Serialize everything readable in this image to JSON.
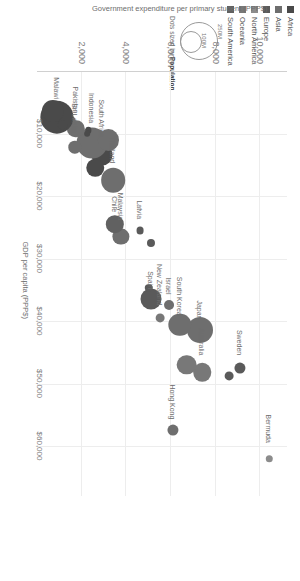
{
  "chart_data": {
    "type": "scatter",
    "title": "",
    "xlabel": "GDP per capita (PPP$)",
    "ylabel": "Government expenditure per primary student (PPP$)",
    "xticks": [
      "$10,000",
      "$20,000",
      "$30,000",
      "$40,000",
      "$50,000",
      "$60,000"
    ],
    "xtick_values": [
      10000,
      20000,
      30000,
      40000,
      50000,
      60000
    ],
    "yticks": [
      "2,000",
      "4,000",
      "6,000",
      "8,000",
      "10,000"
    ],
    "ytick_values": [
      2000,
      4000,
      6000,
      8000,
      10000
    ],
    "xlim": [
      0,
      68000
    ],
    "ylim": [
      0,
      11200
    ],
    "grid": true,
    "size_encoding": "Population",
    "legend_position": "top-left",
    "points": [
      {
        "label": "Bermuda",
        "x": 62000,
        "y": 10400,
        "r": 1.8,
        "continent": "North America",
        "label_dx": -3,
        "label_dy": -44
      },
      {
        "label": "Hong Kong",
        "x": 57500,
        "y": 6100,
        "r": 2.6,
        "continent": "Asia",
        "label_dx": -3,
        "label_dy": -46
      },
      {
        "label": "Sweden",
        "x": 47500,
        "y": 9100,
        "r": 2.6,
        "continent": "Europe",
        "label_dx": -3,
        "label_dy": -38
      },
      {
        "label": "",
        "x": 48800,
        "y": 8600,
        "r": 2.2,
        "continent": "Europe",
        "label_dx": 0,
        "label_dy": 0
      },
      {
        "label": "Australia",
        "x": 48200,
        "y": 7400,
        "r": 4.4,
        "continent": "Oceania",
        "label_dx": -3,
        "label_dy": -44
      },
      {
        "label": "",
        "x": 47000,
        "y": 6700,
        "r": 4.6,
        "continent": "Oceania",
        "label_dx": 0,
        "label_dy": 0
      },
      {
        "label": "New Zealand",
        "x": 39500,
        "y": 5500,
        "r": 2.2,
        "continent": "Oceania",
        "label_dx": -3,
        "label_dy": -54
      },
      {
        "label": "Japan",
        "x": 41500,
        "y": 7300,
        "r": 6.2,
        "continent": "Asia",
        "label_dx": -3,
        "label_dy": -30
      },
      {
        "label": "South Korea",
        "x": 40600,
        "y": 6400,
        "r": 5.4,
        "continent": "Asia",
        "label_dx": -3,
        "label_dy": -48
      },
      {
        "label": "Israel",
        "x": 37500,
        "y": 5900,
        "r": 2.4,
        "continent": "Asia",
        "label_dx": -3,
        "label_dy": -28
      },
      {
        "label": "Spain",
        "x": 36500,
        "y": 5100,
        "r": 5.0,
        "continent": "Europe",
        "label_dx": -3,
        "label_dy": -28
      },
      {
        "label": "",
        "x": 34700,
        "y": 5000,
        "r": 1.8,
        "continent": "Europe",
        "label_dx": 0,
        "label_dy": 0
      },
      {
        "label": "Latvia",
        "x": 25500,
        "y": 4600,
        "r": 1.7,
        "continent": "Europe",
        "label_dx": -3,
        "label_dy": -30
      },
      {
        "label": "",
        "x": 27500,
        "y": 5100,
        "r": 1.9,
        "continent": "Europe",
        "label_dx": 0,
        "label_dy": 0
      },
      {
        "label": "Malaysia",
        "x": 26500,
        "y": 3750,
        "r": 4.0,
        "continent": "Asia",
        "label_dx": -3,
        "label_dy": -44
      },
      {
        "label": "Chile",
        "x": 24500,
        "y": 3500,
        "r": 4.2,
        "continent": "South America",
        "label_dx": -3,
        "label_dy": -28
      },
      {
        "label": "Thailand",
        "x": 17500,
        "y": 3400,
        "r": 5.8,
        "continent": "Asia",
        "label_dx": -3,
        "label_dy": -44
      },
      {
        "label": "South Africa",
        "x": 13500,
        "y": 2900,
        "r": 5.0,
        "continent": "Africa",
        "label_dx": -3,
        "label_dy": -56
      },
      {
        "label": "",
        "x": 15500,
        "y": 2600,
        "r": 4.4,
        "continent": "Africa",
        "label_dx": 0,
        "label_dy": 0
      },
      {
        "label": "Indonesia",
        "x": 11500,
        "y": 2450,
        "r": 7.4,
        "continent": "Asia",
        "label_dx": -3,
        "label_dy": -50
      },
      {
        "label": "",
        "x": 11000,
        "y": 3200,
        "r": 5.2,
        "continent": "Asia",
        "label_dx": 0,
        "label_dy": 0
      },
      {
        "label": "Sri Lanka",
        "x": 12200,
        "y": 1700,
        "r": 3.0,
        "continent": "Asia",
        "label_dx": -3,
        "label_dy": -44
      },
      {
        "label": "Pakistan",
        "x": 9200,
        "y": 1750,
        "r": 4.2,
        "continent": "Asia",
        "label_dx": -3,
        "label_dy": -42
      },
      {
        "label": "",
        "x": 8000,
        "y": 1500,
        "r": 2.6,
        "continent": "Asia",
        "label_dx": 0,
        "label_dy": 0
      },
      {
        "label": "",
        "x": 9500,
        "y": 2300,
        "r": 1.6,
        "continent": "Africa",
        "label_dx": 0,
        "label_dy": 0
      },
      {
        "label": "",
        "x": 10100,
        "y": 2250,
        "r": 1.5,
        "continent": "Africa",
        "label_dx": 0,
        "label_dy": 0
      },
      {
        "label": "Malawi",
        "x": 7400,
        "y": 900,
        "r": 7.8,
        "continent": "Africa",
        "label_dx": -3,
        "label_dy": -40
      },
      {
        "label": "",
        "x": 6400,
        "y": 700,
        "r": 5.2,
        "continent": "Africa",
        "label_dx": 0,
        "label_dy": 0
      },
      {
        "label": "",
        "x": 8600,
        "y": 1150,
        "r": 2.2,
        "continent": "Africa",
        "label_dx": 0,
        "label_dy": 0
      }
    ]
  },
  "legend": {
    "items": [
      {
        "label": "Africa",
        "color": "#4a4a4a"
      },
      {
        "label": "Asia",
        "color": "#6e6e6e"
      },
      {
        "label": "Europe",
        "color": "#5a5a5a"
      },
      {
        "label": "North America",
        "color": "#8c8c8c"
      },
      {
        "label": "Oceania",
        "color": "#787878"
      },
      {
        "label": "South America",
        "color": "#616161"
      }
    ]
  },
  "size_legend": {
    "big_label": "250M",
    "small_label": "100M",
    "caption_prefix": "Dots sized by ",
    "caption_bold": "Population"
  }
}
